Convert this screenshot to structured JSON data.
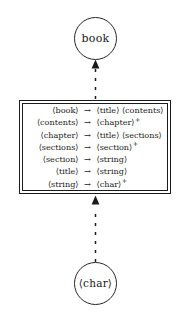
{
  "diagram": {
    "top_node": {
      "label": "book",
      "shape": "circle"
    },
    "bottom_node": {
      "label": "⟨char⟩",
      "shape": "circle"
    },
    "connectors": [
      {
        "name": "box-to-book",
        "style": "dashed",
        "direction": "up",
        "arrowhead": "filled-triangle"
      },
      {
        "name": "char-to-box",
        "style": "dashed",
        "direction": "up",
        "arrowhead": "filled-triangle"
      }
    ],
    "rules_box": {
      "border": "double",
      "arrow_symbol": "→",
      "rules": [
        {
          "lhs": "⟨book⟩",
          "arrow": "→",
          "rhs": "⟨title⟩ ⟨contents⟩",
          "plus": ""
        },
        {
          "lhs": "⟨contents⟩",
          "arrow": "→",
          "rhs": "⟨chapter⟩",
          "plus": "+"
        },
        {
          "lhs": "⟨chapter⟩",
          "arrow": "→",
          "rhs": "⟨title⟩ ⟨sections⟩",
          "plus": ""
        },
        {
          "lhs": "⟨sections⟩",
          "arrow": "→",
          "rhs": "⟨section⟩",
          "plus": "+"
        },
        {
          "lhs": "⟨section⟩",
          "arrow": "→",
          "rhs": "⟨string⟩",
          "plus": ""
        },
        {
          "lhs": "⟨title⟩",
          "arrow": "→",
          "rhs": "⟨string⟩",
          "plus": ""
        },
        {
          "lhs": "⟨string⟩",
          "arrow": "→",
          "rhs": "⟨char⟩",
          "plus": "+"
        }
      ]
    },
    "colors": {
      "ink": "#1a1a1a",
      "background": "#ffffff"
    }
  }
}
